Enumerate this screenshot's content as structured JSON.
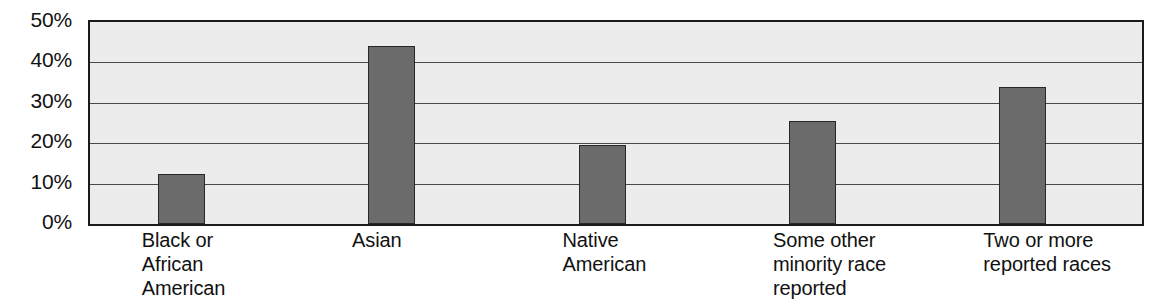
{
  "chart_data": {
    "type": "bar",
    "title": "",
    "xlabel": "",
    "ylabel": "",
    "categories": [
      "Black or\nAfrican\nAmerican",
      "Asian",
      "Native\nAmerican",
      "Some other\nminority race\nreported",
      "Two or more\nreported races"
    ],
    "values": [
      12.3,
      44.0,
      19.5,
      25.5,
      34.0
    ],
    "ylim": [
      0,
      50
    ],
    "ytick_labels": [
      "0%",
      "10%",
      "20%",
      "30%",
      "40%",
      "50%"
    ],
    "ytick_values": [
      0,
      10,
      20,
      30,
      40,
      50
    ],
    "grid": true,
    "legend": "none",
    "colors": {
      "bar_fill": "#6b6b6b",
      "bar_border": "#272727",
      "plot_background": "#ececec",
      "plot_border": "#1a1a1a",
      "gridline": "#4a4a4a",
      "text": "#111111",
      "page_background": "#ffffff"
    }
  }
}
